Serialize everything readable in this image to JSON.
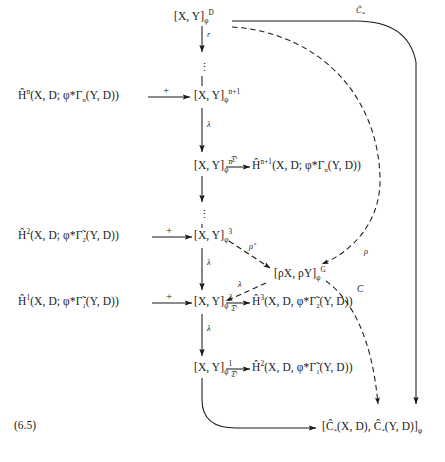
{
  "figure": {
    "equation_number": "(6.5)",
    "type": "commutative-diagram",
    "caption": ""
  },
  "nodes": {
    "top_XY_D": "[X, Y]",
    "top_XY_D_sub": "φ",
    "top_XY_D_sup": "D",
    "Hn_left": "Ĥ",
    "Hn_left_sup": "n",
    "Hn_left_rest": "(X, D; φ*Γ",
    "Hn_left_sub": "n",
    "Hn_left_tail": "(Y, D))",
    "XY_n1": "[X, Y]",
    "XY_n1_sub": "φ",
    "XY_n1_sup": "n+1",
    "XY_n": "[X, Y]",
    "XY_n_sub": "φ",
    "XY_n_sup": "n",
    "Hn1_right": "Ĥ",
    "Hn1_right_sup": "n+1",
    "Hn1_right_rest": "(X, D; φ*Γ",
    "Hn1_right_sub": "n",
    "Hn1_right_tail": "(Y, D))",
    "H2_left": "Ĥ",
    "H2_left_sup": "2",
    "H2_left_rest": "(X, D; φ*Γ̃",
    "H2_left_sub": "2",
    "H2_left_tail": "(Y, D))",
    "XY_3": "[X, Y]",
    "XY_3_sub": "φ",
    "XY_3_sup": "3",
    "rhoXY": "[ρX, ρY]",
    "rhoXY_sub": "φ",
    "rhoXY_sup": "G",
    "H1_left": "Ĥ",
    "H1_left_sup": "1",
    "H1_left_rest": "(X, D; φ*Γ̃",
    "H1_left_sub": "1",
    "H1_left_tail": "(Y, D))",
    "XY_2": "[X, Y]",
    "XY_2_sub": "φ",
    "XY_2_sup": "2",
    "H3_right": "Ĥ",
    "H3_right_sup": "3",
    "H3_right_rest": "(X, D, φ*Γ̃",
    "H3_right_sub": "2",
    "H3_right_tail": "(Y, D))",
    "XY_1": "[X, Y]",
    "XY_1_sub": "φ",
    "XY_1_sup": "1",
    "H2_right": "Ĥ",
    "H2_right_sup": "2",
    "H2_right_rest": "(X, D, φ*Γ̃",
    "H2_right_sub": "1",
    "H2_right_tail": "(Y, D))",
    "bottom": "[Ĉ",
    "bottom_sub1": "*",
    "bottom_mid": "(X, D), Ĉ",
    "bottom_sub2": "*",
    "bottom_tail": "(Y, D)]",
    "bottom_sub3": "φ"
  },
  "arrow_labels": {
    "r": "r",
    "lambda1": "λ",
    "lambda2": "λ",
    "lambda3": "λ",
    "lambda4": "λ",
    "lambda_diag": "λ",
    "plus1": "+",
    "plus2": "+",
    "plus3": "+",
    "script_d1": "𝔇",
    "script_d2": "𝔇",
    "script_d3": "𝔇",
    "C_hat_star": "Ĉ",
    "C_hat_star_sub": "*",
    "rho_tilde": "ρ̃",
    "rho": "ρ",
    "C": "C"
  },
  "vertical_dots": {
    "dots1": "⋮",
    "dots2": "⋮",
    "dots3": "⋮"
  },
  "colors": {
    "ink": "#1a1a1a",
    "background": "#ffffff"
  }
}
